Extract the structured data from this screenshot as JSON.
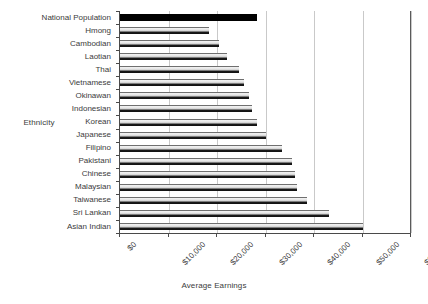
{
  "chart_data": {
    "type": "bar",
    "orientation": "horizontal",
    "title": "",
    "xlabel": "Average Earnings",
    "ylabel": "Ethnicity",
    "xlim": [
      0,
      60000
    ],
    "xtick_values": [
      0,
      10000,
      20000,
      30000,
      40000,
      50000,
      60000
    ],
    "xtick_labels": [
      "$0",
      "$10,000",
      "$20,000",
      "$30,000",
      "$40,000",
      "$50,000",
      "$60,000"
    ],
    "grid": true,
    "grid_axis": "x",
    "legend": false,
    "categories": [
      "National Population",
      "Hmong",
      "Cambodian",
      "Laotian",
      "Thai",
      "Vietnamese",
      "Okinawan",
      "Indonesian",
      "Korean",
      "Japanese",
      "Filipino",
      "Pakistani",
      "Chinese",
      "Malaysian",
      "Taiwanese",
      "Sri Lankan",
      "Asian Indian"
    ],
    "values": [
      28200,
      18400,
      20400,
      22000,
      24500,
      25500,
      26500,
      27200,
      28300,
      30000,
      33500,
      35500,
      36000,
      36500,
      38500,
      43000,
      50100
    ],
    "highlight_category": "National Population",
    "highlight_color": "#000000",
    "bar_color": "#e2e2e2",
    "bar_edge_color": "#111111",
    "gridline_color": "#c9c9c9",
    "axis_color": "#4a4a4a"
  }
}
